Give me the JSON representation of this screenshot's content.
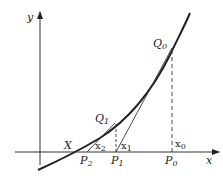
{
  "diagram": {
    "axes": {
      "x_label": "x",
      "y_label": "y"
    },
    "points": {
      "Q0": {
        "label": "Q",
        "sub": "0"
      },
      "Q1": {
        "label": "Q",
        "sub": "1"
      },
      "P0": {
        "label": "P",
        "sub": "0"
      },
      "P1": {
        "label": "P",
        "sub": "1"
      },
      "P2": {
        "label": "P",
        "sub": "2"
      },
      "X": {
        "label": "X"
      }
    },
    "values": {
      "x0": {
        "label": "x",
        "sub": "0"
      },
      "x1": {
        "label": "x",
        "sub": "1"
      },
      "x2": {
        "label": "x",
        "sub": "2"
      }
    },
    "colors": {
      "stroke": "#222222",
      "background": "#ffffff"
    }
  }
}
